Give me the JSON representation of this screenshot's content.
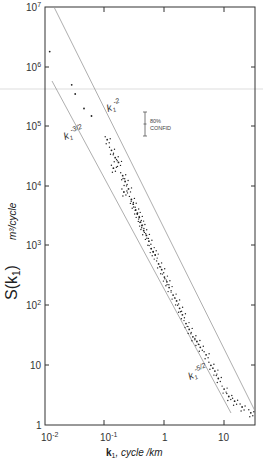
{
  "chart_data": {
    "type": "scatter",
    "title": "",
    "xlabel": "k1, cycle/km",
    "ylabel": "S(k1)  m^3/cycle",
    "xscale": "log",
    "yscale": "log",
    "xlim": [
      0.01,
      35
    ],
    "ylim": [
      1,
      10000000
    ],
    "x_ticks": [
      "10^-2",
      "10^-1",
      "1",
      "10"
    ],
    "y_ticks": [
      "1",
      "10",
      "10^2",
      "10^3",
      "10^4",
      "10^5",
      "10^6",
      "10^7"
    ],
    "grid": false,
    "reference_lines": [
      {
        "label": "k1^-2",
        "slope": -2,
        "points": [
          [
            0.014,
            10000000
          ],
          [
            35,
            1.6
          ]
        ]
      },
      {
        "label": "k1^-3/2",
        "slope": -1.5,
        "points": [
          [
            0.013,
            450000
          ],
          [
            13,
            15
          ]
        ]
      }
    ],
    "annotations": [
      {
        "text": "k1^-2",
        "x": 0.33,
        "y": 60000
      },
      {
        "text": "k1^-3/2",
        "x": 0.018,
        "y": 50000
      },
      {
        "text": "k1^-5/2",
        "x": 2.5,
        "y": 15
      },
      {
        "text": "80% CONFID",
        "x": 1.2,
        "y": 100000,
        "type": "error-bar"
      }
    ],
    "series": [
      {
        "name": "spectral estimates",
        "x": [
          0.012,
          0.028,
          0.032,
          0.045,
          0.06,
          0.11,
          0.13,
          0.15,
          0.14,
          0.17,
          0.2,
          0.22,
          0.25,
          0.21,
          0.28,
          0.3,
          0.33,
          0.35,
          0.38,
          0.4,
          0.42,
          0.45,
          0.5,
          0.55,
          0.6,
          0.65,
          0.7,
          0.8,
          0.9,
          1.0,
          1.1,
          1.2,
          1.4,
          1.6,
          1.8,
          2.0,
          2.3,
          2.6,
          3.0,
          3.5,
          4.0,
          5.0,
          6.0,
          7.0,
          8.0,
          10.0,
          12.0,
          15.0,
          20.0,
          28.0
        ],
        "y": [
          1800000,
          500000,
          350000,
          200000,
          150000,
          60000,
          40000,
          30000,
          20000,
          25000,
          15000,
          12000,
          9000,
          8000,
          6000,
          5000,
          4000,
          3500,
          3000,
          2500,
          2200,
          1800,
          1500,
          1200,
          900,
          800,
          700,
          500,
          400,
          300,
          250,
          200,
          150,
          120,
          90,
          70,
          50,
          40,
          30,
          25,
          20,
          15,
          10,
          8,
          6,
          4,
          3,
          2.5,
          2,
          1.6
        ]
      }
    ]
  },
  "axes": {
    "y_title_main": "S(k",
    "y_title_sub": "1",
    "y_title_close": ")",
    "y_units": "m³/cycle",
    "x_title_k": "k",
    "x_title_sub": "1",
    "x_title_rest": ", cycle /km",
    "x_tick_labels": [
      "10",
      "10",
      "1",
      "10"
    ],
    "x_tick_sups": [
      "-2",
      "-1",
      "",
      ""
    ],
    "y_tick_labels": [
      "10",
      "10",
      "10",
      "10",
      "10",
      "10",
      "10",
      "1"
    ],
    "y_tick_sups": [
      "7",
      "6",
      "5",
      "4",
      "3",
      "2",
      "",
      ""
    ]
  },
  "labels": {
    "k2": "k",
    "k2_sub": "1",
    "k2_sup": "-2",
    "k32": "k",
    "k32_sub": "1",
    "k32_sup": "-3/2",
    "k52": "k",
    "k52_sub": "1",
    "k52_sup": "-5/2",
    "confid_line1": "80%",
    "confid_line2": "CONFID"
  }
}
